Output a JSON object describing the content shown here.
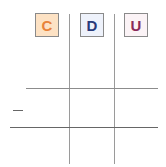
{
  "headers": [
    {
      "label": "C",
      "color": "#e8823a",
      "bg": "#fde2c4"
    },
    {
      "label": "D",
      "color": "#2a3a7a",
      "bg": "#eef2fb"
    },
    {
      "label": "U",
      "color": "#8a2a5a",
      "bg": "#fbf3f6"
    }
  ],
  "row_marker": "—"
}
